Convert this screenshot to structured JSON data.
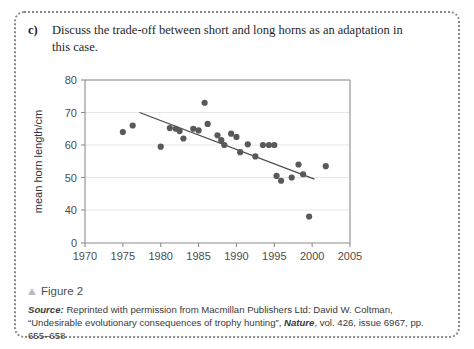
{
  "question": {
    "label": "c)",
    "text": "Discuss the trade-off between short and long horns as an adaptation in this case."
  },
  "figure": {
    "caption": "Figure 2",
    "marker_icon": "triangle-bullet-icon"
  },
  "source": {
    "label": "Source:",
    "part1": " Reprinted with permission from Macmillan Publishers Ltd: David W. Coltman, “Undesirable evolutionary consequences of trophy hunting”, ",
    "journal": "Nature",
    "part2": ", vol. 426, issue 6967, pp. 655–658"
  },
  "chart_data": {
    "type": "scatter",
    "title": "",
    "xlabel": "year",
    "ylabel": "mean horn length/cm",
    "xlim": [
      1970,
      2005
    ],
    "ylim": [
      0,
      80
    ],
    "y_axis_break": true,
    "xticks": [
      1970,
      1975,
      1980,
      1985,
      1990,
      1995,
      2000,
      2005
    ],
    "yticks": [
      0,
      40,
      50,
      60,
      70,
      80
    ],
    "ytick_positions": [
      0,
      40,
      50,
      60,
      70,
      80
    ],
    "grid": "horizontal",
    "marker_color": "#595959",
    "line_color": "#4a4a4a",
    "axis_color": "#8c8c8c",
    "points": [
      {
        "x": 1975.0,
        "y": 64.0
      },
      {
        "x": 1976.3,
        "y": 66.0
      },
      {
        "x": 1980.0,
        "y": 59.5
      },
      {
        "x": 1981.2,
        "y": 65.2
      },
      {
        "x": 1982.0,
        "y": 65.0
      },
      {
        "x": 1982.5,
        "y": 64.3
      },
      {
        "x": 1983.0,
        "y": 62.0
      },
      {
        "x": 1984.3,
        "y": 65.0
      },
      {
        "x": 1985.0,
        "y": 64.5
      },
      {
        "x": 1985.8,
        "y": 73.0
      },
      {
        "x": 1986.2,
        "y": 66.5
      },
      {
        "x": 1987.5,
        "y": 63.0
      },
      {
        "x": 1988.0,
        "y": 61.5
      },
      {
        "x": 1988.4,
        "y": 60.0
      },
      {
        "x": 1989.3,
        "y": 63.5
      },
      {
        "x": 1990.0,
        "y": 62.5
      },
      {
        "x": 1990.5,
        "y": 57.8
      },
      {
        "x": 1991.5,
        "y": 60.2
      },
      {
        "x": 1992.5,
        "y": 56.5
      },
      {
        "x": 1993.5,
        "y": 60.0
      },
      {
        "x": 1994.3,
        "y": 60.0
      },
      {
        "x": 1995.0,
        "y": 60.0
      },
      {
        "x": 1995.3,
        "y": 50.5
      },
      {
        "x": 1995.9,
        "y": 49.0
      },
      {
        "x": 1997.3,
        "y": 50.0
      },
      {
        "x": 1998.2,
        "y": 54.0
      },
      {
        "x": 1998.8,
        "y": 51.0
      },
      {
        "x": 1999.6,
        "y": 38.0
      },
      {
        "x": 2001.8,
        "y": 53.5
      }
    ],
    "trend_line": {
      "x1": 1977.2,
      "y1": 70.0,
      "x2": 2000.3,
      "y2": 49.5
    }
  }
}
